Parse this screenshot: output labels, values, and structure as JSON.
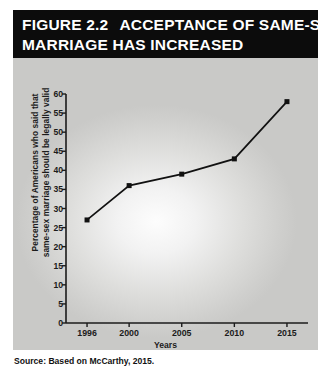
{
  "figure": {
    "number_label": "FIGURE 2.2",
    "title_rest": "ACCEPTANCE OF SAME-SEX",
    "title_line2": "MARRIAGE HAS INCREASED",
    "title_bar_color": "#0c0c0c",
    "title_text_color": "#ffffff"
  },
  "source": {
    "text": "Source: Based on McCarthy, 2015."
  },
  "chart_data": {
    "type": "line",
    "xlabel": "Years",
    "ylabel_line1": "Percentage of Americans who said that",
    "ylabel_line2": "same-sex marriage should be legally valid",
    "ylabel": "Percentage of Americans who said that same-sex marriage should be legally valid",
    "categories": [
      "1996",
      "2000",
      "2005",
      "2010",
      "2015"
    ],
    "x": [
      1996,
      2000,
      2005,
      2010,
      2015
    ],
    "values": [
      27,
      36,
      39,
      43,
      58
    ],
    "xlim": [
      1994,
      2017
    ],
    "ylim": [
      0,
      60
    ],
    "yticks": [
      "0",
      "5",
      "10",
      "15",
      "20",
      "25",
      "30",
      "35",
      "40",
      "45",
      "50",
      "55",
      "60"
    ],
    "ytick_values": [
      0,
      5,
      10,
      15,
      20,
      25,
      30,
      35,
      40,
      45,
      50,
      55,
      60
    ],
    "xticks": [
      "1996",
      "2000",
      "2005",
      "2010",
      "2015"
    ],
    "grid": false,
    "legend": false,
    "marker": "square",
    "line_color": "#111111",
    "marker_color": "#111111",
    "plot_background": "#d8d8d6"
  }
}
